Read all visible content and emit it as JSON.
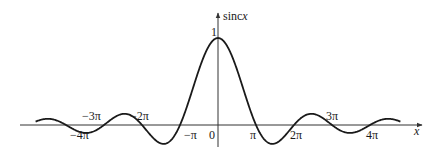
{
  "chart_data": {
    "type": "line",
    "title": "",
    "function": "sinc x = sin(x)/x",
    "xlabel": "x",
    "ylabel_prefix": "sinc",
    "ylabel_var": "x",
    "xlim_pi": [
      -4.8,
      4.8
    ],
    "ylim": [
      -0.3,
      1.2
    ],
    "grid": false,
    "legend": "none",
    "series": [
      {
        "name": "sinc x",
        "x_range_pi": [
          -4.8,
          4.8
        ],
        "peak": {
          "x": 0,
          "y": 1
        }
      }
    ],
    "y_tick_labels": [
      {
        "value": 1,
        "label": "1"
      }
    ],
    "x_tick_labels": [
      {
        "value_pi": -4,
        "label": "−4π",
        "side": "below"
      },
      {
        "value_pi": -3,
        "label": "−3π",
        "side": "above"
      },
      {
        "value_pi": -2,
        "label": "−2π",
        "side": "above"
      },
      {
        "value_pi": -1,
        "label": "−π",
        "side": "below"
      },
      {
        "value_pi": 0,
        "label": "0",
        "side": "below"
      },
      {
        "value_pi": 1,
        "label": "π",
        "side": "below"
      },
      {
        "value_pi": 2,
        "label": "2π",
        "side": "below"
      },
      {
        "value_pi": 3,
        "label": "3π",
        "side": "above"
      },
      {
        "value_pi": 4,
        "label": "4π",
        "side": "below"
      }
    ],
    "line_color": "#1a1a1a",
    "axis_color": "#333333"
  }
}
